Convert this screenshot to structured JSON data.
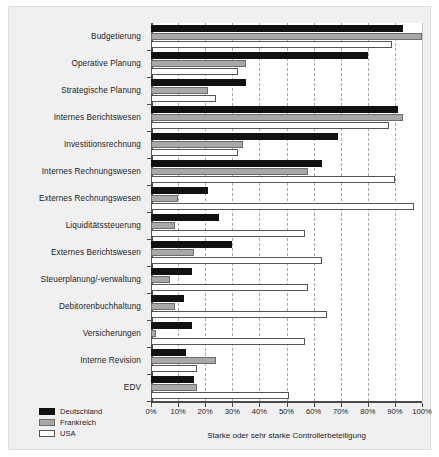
{
  "chart_data": {
    "type": "bar",
    "orientation": "horizontal",
    "title": "",
    "xlabel": "Starke oder sehr starke Controllerbeteiligung",
    "ylabel": "",
    "xlim": [
      0,
      100
    ],
    "xticks": [
      "0%",
      "10%",
      "20%",
      "30%",
      "40%",
      "50%",
      "60%",
      "70%",
      "80%",
      "90%",
      "100%"
    ],
    "xtick_values": [
      0,
      10,
      20,
      30,
      40,
      50,
      60,
      70,
      80,
      90,
      100
    ],
    "grid": true,
    "legend_position": "bottom-left",
    "categories": [
      "Budgetierung",
      "Operative Planung",
      "Strategische Planung",
      "Internes Berichtswesen",
      "Investitionsrechnung",
      "Internes Rechnungswesen",
      "Externes Rechnungswesen",
      "Liquiditätssteuerung",
      "Externes Berichtswesen",
      "Steuerplanung/-verwaltung",
      "Debitorenbuchhaltung",
      "Versicherungen",
      "Interne Revision",
      "EDV"
    ],
    "series": [
      {
        "name": "Deutschland",
        "color": "#111111",
        "values": [
          93,
          80,
          35,
          91,
          69,
          63,
          21,
          25,
          30,
          15,
          12,
          15,
          13,
          16
        ]
      },
      {
        "name": "Frankreich",
        "color": "#a8a8a8",
        "values": [
          100,
          35,
          21,
          93,
          34,
          58,
          10,
          9,
          16,
          7,
          9,
          2,
          24,
          17
        ]
      },
      {
        "name": "USA",
        "color": "#ffffff",
        "values": [
          89,
          32,
          24,
          88,
          32,
          90,
          97,
          57,
          63,
          58,
          65,
          57,
          17,
          51
        ]
      }
    ]
  },
  "legend": {
    "items": [
      {
        "label": "Deutschland",
        "swatch": "de"
      },
      {
        "label": "Frankreich",
        "swatch": "fr"
      },
      {
        "label": "USA",
        "swatch": "us"
      }
    ]
  }
}
